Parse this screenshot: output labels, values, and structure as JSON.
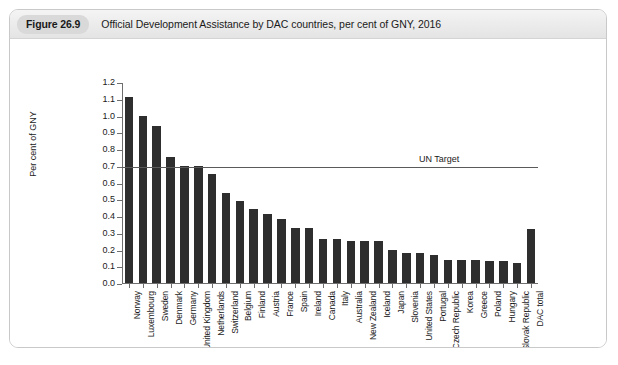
{
  "figure": {
    "badge": "Figure 26.9",
    "caption": "Official Development Assistance by DAC countries, per cent of GNY, 2016"
  },
  "chart_data": {
    "type": "bar",
    "title": "Official Development Assistance by DAC countries, per cent of GNY, 2016",
    "xlabel": "",
    "ylabel": "Per cent of GNY",
    "ylim": [
      0.0,
      1.2
    ],
    "ytick_labels": [
      "0.0",
      "0.1",
      "0.2",
      "0.3",
      "0.4",
      "0.5",
      "0.6",
      "0.7",
      "0.8",
      "0.9",
      "1.0",
      "1.1",
      "1.2"
    ],
    "ytick_values": [
      0.0,
      0.1,
      0.2,
      0.3,
      0.4,
      0.5,
      0.6,
      0.7,
      0.8,
      0.9,
      1.0,
      1.1,
      1.2
    ],
    "grid": false,
    "legend": "none",
    "bar_color": "#2e2e2e",
    "annotations": [
      {
        "label": "UN Target",
        "type": "hline",
        "value": 0.7,
        "color": "#5a5a5a"
      }
    ],
    "categories": [
      "Norway",
      "Luxembourg",
      "Sweden",
      "Denmark",
      "Germany",
      "United Kingdom",
      "Netherlands",
      "Switzerland",
      "Belgium",
      "Finland",
      "Austria",
      "France",
      "Spain",
      "Ireland",
      "Canada",
      "Italy",
      "Australia",
      "New Zealand",
      "Iceland",
      "Japan",
      "Slovenia",
      "United States",
      "Portugal",
      "Czech Republic",
      "Korea",
      "Greece",
      "Poland",
      "Hungary",
      "Slovak Republic",
      "DAC total"
    ],
    "values": [
      1.11,
      1.0,
      0.94,
      0.75,
      0.7,
      0.7,
      0.65,
      0.54,
      0.49,
      0.44,
      0.41,
      0.38,
      0.33,
      0.33,
      0.26,
      0.26,
      0.25,
      0.25,
      0.25,
      0.2,
      0.18,
      0.18,
      0.17,
      0.14,
      0.14,
      0.14,
      0.13,
      0.13,
      0.12,
      0.32
    ]
  }
}
